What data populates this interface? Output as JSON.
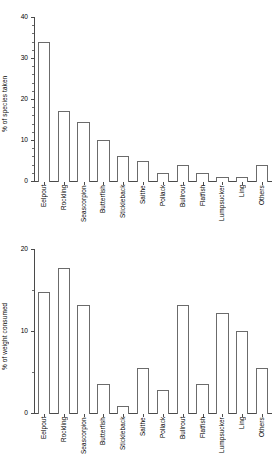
{
  "figure": {
    "panel_count": 2
  },
  "chart_data": [
    {
      "type": "bar",
      "panel": "top",
      "title": "",
      "xlabel": "",
      "ylabel": "% of species taken",
      "ylim": [
        0,
        40
      ],
      "yticks": [
        0,
        10,
        20,
        30,
        40
      ],
      "ytick_labels": [
        "0",
        "10",
        "20",
        "30",
        "40"
      ],
      "yminor_step": 2,
      "grid": false,
      "legend": false,
      "categories": [
        "Eelpout",
        "Rockling",
        "Seascorpion",
        "Butterfish",
        "Stickleback",
        "Saithe",
        "Pollack",
        "Bullrout",
        "Flatfish",
        "Lumpsucker",
        "Ling",
        "Others"
      ],
      "values": [
        34,
        17,
        14.3,
        10,
        6,
        5,
        2,
        4,
        2,
        1,
        1,
        4
      ]
    },
    {
      "type": "bar",
      "panel": "bottom",
      "title": "",
      "xlabel": "",
      "ylabel": "% of weight consumed",
      "ylim": [
        0,
        20
      ],
      "yticks": [
        0,
        10,
        20
      ],
      "ytick_labels": [
        "0",
        "10",
        "20"
      ],
      "yminor_step": 5,
      "grid": false,
      "legend": false,
      "categories": [
        "Eelpout",
        "Rockling",
        "Seascorpion",
        "Butterfish",
        "Stickleback",
        "Saithe",
        "Pollack",
        "Bullrout",
        "Flatfish",
        "Lumpsucker",
        "Ling",
        "Others"
      ],
      "values": [
        14.7,
        17.7,
        13.2,
        3.5,
        0.8,
        5.5,
        2.8,
        13.2,
        3.5,
        12.2,
        10,
        5.5
      ]
    }
  ]
}
